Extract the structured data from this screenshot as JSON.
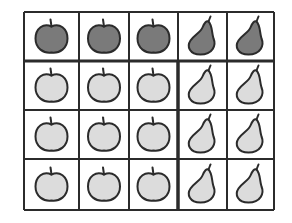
{
  "figure": {
    "rows": 4,
    "cols": 5,
    "colors": {
      "dark_fill": "#7a7a7a",
      "light_fill": "#dcdcdc",
      "outline": "#2b2b2b",
      "grid_line": "#2b2b2b",
      "background": "#ffffff"
    },
    "cells": [
      [
        {
          "fruit": "apple",
          "shade": "dark"
        },
        {
          "fruit": "apple",
          "shade": "dark"
        },
        {
          "fruit": "apple",
          "shade": "dark"
        },
        {
          "fruit": "pear",
          "shade": "dark"
        },
        {
          "fruit": "pear",
          "shade": "dark"
        }
      ],
      [
        {
          "fruit": "apple",
          "shade": "light"
        },
        {
          "fruit": "apple",
          "shade": "light"
        },
        {
          "fruit": "apple",
          "shade": "light"
        },
        {
          "fruit": "pear",
          "shade": "light"
        },
        {
          "fruit": "pear",
          "shade": "light"
        }
      ],
      [
        {
          "fruit": "apple",
          "shade": "light"
        },
        {
          "fruit": "apple",
          "shade": "light"
        },
        {
          "fruit": "apple",
          "shade": "light"
        },
        {
          "fruit": "pear",
          "shade": "light"
        },
        {
          "fruit": "pear",
          "shade": "light"
        }
      ],
      [
        {
          "fruit": "apple",
          "shade": "light"
        },
        {
          "fruit": "apple",
          "shade": "light"
        },
        {
          "fruit": "apple",
          "shade": "light"
        },
        {
          "fruit": "pear",
          "shade": "light"
        },
        {
          "fruit": "pear",
          "shade": "light"
        }
      ]
    ],
    "counts": {
      "apples_dark": 3,
      "pears_dark": 2,
      "apples_light": 9,
      "pears_light": 6,
      "total": 20
    }
  }
}
